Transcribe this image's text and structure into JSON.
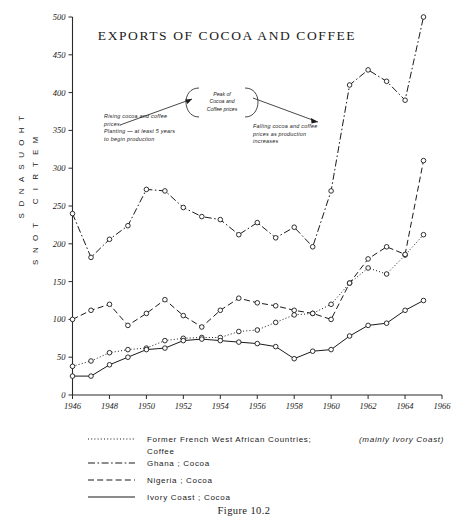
{
  "figure": {
    "caption": "Figure 10.2",
    "title": "EXPORTS OF COCOA AND COFFEE"
  },
  "axes": {
    "y_name_line1": "THOUSANDS",
    "y_name_line2": "METRIC TONS",
    "y_ticks": [
      "0",
      "50",
      "100",
      "150",
      "200",
      "250",
      "300",
      "350",
      "400",
      "450",
      "500"
    ],
    "x_ticks": [
      "1946",
      "1948",
      "1950",
      "1952",
      "1954",
      "1956",
      "1958",
      "1960",
      "1962",
      "1964",
      "1966"
    ]
  },
  "annotations": {
    "bubble": [
      "Peak of",
      "Cocoa and",
      "Coffee prices"
    ],
    "left": [
      "Rising cocoa and coffee",
      "prices.",
      "Planting — at least 5 years",
      "to begin  production"
    ],
    "right": [
      "Falling  cocoa  and coffee",
      "prices as production",
      "increases"
    ]
  },
  "legend": {
    "items": [
      {
        "style": "dotted",
        "label_main": "Former  French   West   African   Countries;",
        "label_ital": "(mainly  Ivory  Coast)",
        "label_line2": "Coffee"
      },
      {
        "style": "dashdot",
        "label_main": "Ghana ;  Cocoa",
        "label_ital": "",
        "label_line2": ""
      },
      {
        "style": "dashed",
        "label_main": "Nigeria ;  Cocoa",
        "label_ital": "",
        "label_line2": ""
      },
      {
        "style": "solid",
        "label_main": "Ivory  Coast ;  Cocoa",
        "label_ital": "",
        "label_line2": ""
      }
    ]
  },
  "chart_data": {
    "type": "line",
    "title": "EXPORTS OF COCOA AND COFFEE",
    "xlabel": "",
    "ylabel": "THOUSANDS METRIC TONS",
    "xlim": [
      1946,
      1966
    ],
    "ylim": [
      0,
      500
    ],
    "grid": false,
    "legend_position": "below-plot",
    "x": [
      1946,
      1947,
      1948,
      1949,
      1950,
      1951,
      1952,
      1953,
      1954,
      1955,
      1956,
      1957,
      1958,
      1959,
      1960,
      1961,
      1962,
      1963,
      1964,
      1965
    ],
    "series": [
      {
        "name": "Former French West African Countries; (mainly Ivory Coast) Coffee",
        "style": "dotted",
        "values": [
          38,
          45,
          56,
          60,
          62,
          72,
          75,
          76,
          76,
          84,
          86,
          96,
          106,
          108,
          120,
          148,
          168,
          160,
          185,
          212
        ]
      },
      {
        "name": "Ghana; Cocoa",
        "style": "dashdot",
        "values": [
          240,
          182,
          206,
          224,
          272,
          270,
          248,
          236,
          232,
          212,
          228,
          208,
          222,
          196,
          270,
          410,
          430,
          415,
          390,
          500
        ]
      },
      {
        "name": "Nigeria; Cocoa",
        "style": "dashed",
        "values": [
          100,
          112,
          120,
          92,
          108,
          126,
          105,
          90,
          112,
          128,
          122,
          118,
          112,
          108,
          100,
          148,
          180,
          196,
          186,
          310
        ]
      },
      {
        "name": "Ivory Coast; Cocoa",
        "style": "solid",
        "values": [
          25,
          25,
          40,
          50,
          60,
          62,
          72,
          74,
          72,
          70,
          68,
          64,
          48,
          58,
          60,
          78,
          92,
          95,
          112,
          125
        ]
      }
    ],
    "annotations": [
      {
        "text": "Peak of Cocoa and Coffee prices",
        "near_x": 1954
      },
      {
        "text": "Rising cocoa and coffee prices. Planting — at least 5 years to begin production",
        "near_x": 1950
      },
      {
        "text": "Falling cocoa and coffee prices as production increases",
        "near_x": 1958
      }
    ]
  }
}
